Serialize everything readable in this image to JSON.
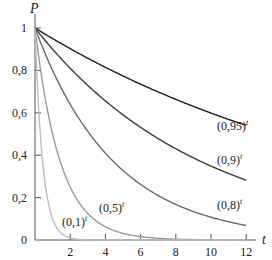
{
  "chart_data": {
    "type": "line",
    "title": "",
    "xlabel": "t",
    "ylabel": "P",
    "xlim": [
      0,
      12
    ],
    "ylim": [
      0,
      1
    ],
    "grid": false,
    "legend": "inline labels at curve ends",
    "x_ticks": [
      "2",
      "4",
      "6",
      "8",
      "10",
      "12"
    ],
    "y_ticks": [
      "0",
      "0,2",
      "0,4",
      "0,6",
      "0,8",
      "1"
    ],
    "series": [
      {
        "name": "(0,95)^t",
        "base": 0.95,
        "color": "#1e1e1e",
        "label_base": "(0,95)",
        "label_exp": "t"
      },
      {
        "name": "(0,9)^t",
        "base": 0.9,
        "color": "#3c3c3c",
        "label_base": "(0,9)",
        "label_exp": "t"
      },
      {
        "name": "(0,8)^t",
        "base": 0.8,
        "color": "#6a6a6a",
        "label_base": "(0,8)",
        "label_exp": "t"
      },
      {
        "name": "(0,5)^t",
        "base": 0.5,
        "color": "#9a9a9a",
        "label_base": "(0,5)",
        "label_exp": "t"
      },
      {
        "name": "(0,1)^t",
        "base": 0.1,
        "color": "#bdbdbd",
        "label_base": "(0,1)",
        "label_exp": "t"
      }
    ],
    "x": [
      0,
      2,
      4,
      6,
      8,
      10,
      12
    ],
    "values_approx": {
      "(0,95)^t": [
        1.0,
        0.9,
        0.81,
        0.74,
        0.66,
        0.6,
        0.54
      ],
      "(0,9)^t": [
        1.0,
        0.81,
        0.66,
        0.53,
        0.43,
        0.35,
        0.28
      ],
      "(0,8)^t": [
        1.0,
        0.64,
        0.41,
        0.26,
        0.17,
        0.11,
        0.07
      ],
      "(0,5)^t": [
        1.0,
        0.25,
        0.06,
        0.02,
        0.0,
        0.0,
        0.0
      ],
      "(0,1)^t": [
        1.0,
        0.01,
        0.0,
        0.0,
        0.0,
        0.0,
        0.0
      ]
    }
  }
}
